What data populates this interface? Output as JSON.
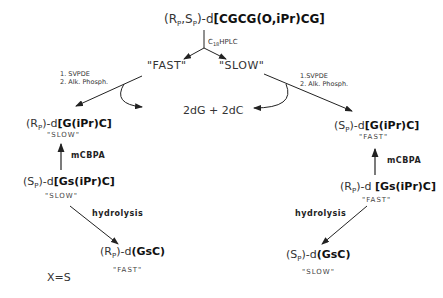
{
  "top_compound": {
    "prefix": "(R",
    "sub1": "P",
    "mid": ",S",
    "sub2": "P",
    "suffix": ")-d",
    "bold": "[CGCG(O,iPr)CG]"
  },
  "hplc_label": {
    "main": "C",
    "sub": "18",
    "rest": "HPLC"
  },
  "fast_top": "\"FAST\"",
  "slow_top": "\"SLOW\"",
  "left_reagents": [
    "1. SVPDE",
    "2. Alk. Phosph."
  ],
  "right_reagents": [
    "1.SVPDE",
    "2. Alk. Phosph."
  ],
  "center_product": "2dG + 2dC",
  "left_rp": {
    "pre": "(R",
    "sub": "P",
    "post": ")-d",
    "bold": "[G(iPr)C]",
    "label": "\"SLOW\""
  },
  "right_sp": {
    "pre": "(S",
    "sub": "P",
    "post": ")-d",
    "bold": "[G(iPr)C]",
    "label": "\"FAST\""
  },
  "mcbpa": "mCBPA",
  "left_sp_gs": {
    "pre": "(S",
    "sub": "P",
    "post": ")-d",
    "bold": "[Gs(iPr)C]",
    "label": "\"SLOW\""
  },
  "right_rp_gs": {
    "pre": "(R",
    "sub": "P",
    "post": ")-d ",
    "bold": "[Gs(iPr)C]",
    "label": "\"FAST\""
  },
  "hydrolysis": "hydrolysis",
  "left_final": {
    "pre": "(R",
    "sub": "P",
    "post": ")-d",
    "bold": "(GsC)",
    "label": "\"FAST\""
  },
  "right_final": {
    "pre": "(S",
    "sub": "P",
    "post": ")-d",
    "bold": "(GsC)",
    "label": "\"SLOW\""
  },
  "footnote": "X=S"
}
